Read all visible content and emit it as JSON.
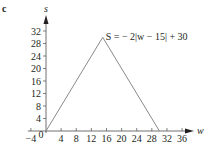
{
  "panel_label": "c",
  "chart_data": {
    "type": "line",
    "title": "",
    "annotation": "S = − 2|w − 15| + 30",
    "xlabel": "w",
    "ylabel": "s",
    "x_ticks": [
      -4,
      0,
      4,
      8,
      12,
      16,
      20,
      24,
      28,
      32,
      36
    ],
    "x_tick_labels": [
      "−4",
      "0",
      "4",
      "8",
      "12",
      "16",
      "20",
      "24",
      "28",
      "32",
      "36"
    ],
    "y_ticks": [
      4,
      8,
      12,
      16,
      20,
      24,
      28,
      32
    ],
    "y_tick_labels": [
      "4",
      "8",
      "12",
      "16",
      "20",
      "24",
      "28",
      "32"
    ],
    "xlim": [
      -4,
      37
    ],
    "ylim": [
      0,
      34
    ],
    "grid": false,
    "series": [
      {
        "name": "S = − 2|w − 15| + 30",
        "x": [
          0,
          15,
          30
        ],
        "y": [
          0,
          30,
          0
        ],
        "color": "#8a8a8a"
      }
    ]
  }
}
